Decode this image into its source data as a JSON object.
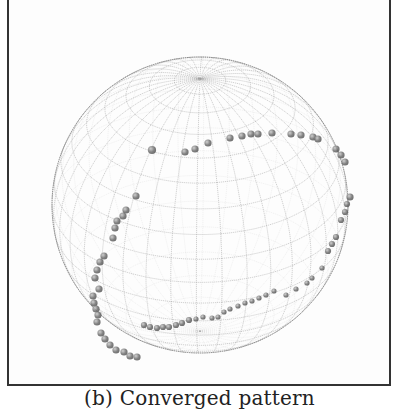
{
  "figure": {
    "caption": "(b) Converged pattern",
    "sphere": {
      "cx": 200,
      "cy": 205,
      "r": 148,
      "wire_color": "#9a9a9a",
      "outline_color": "#777777"
    },
    "point_color": "#6e6e6e",
    "upper_chain": [
      [
        152,
        150,
        7
      ],
      [
        185,
        152,
        6
      ],
      [
        195,
        149,
        6
      ],
      [
        208,
        143,
        6
      ],
      [
        230,
        138,
        6
      ],
      [
        242,
        136,
        6
      ],
      [
        251,
        134,
        6
      ],
      [
        258,
        134,
        6
      ],
      [
        272,
        133,
        6
      ],
      [
        291,
        134,
        6
      ],
      [
        301,
        135,
        6
      ],
      [
        313,
        137,
        6
      ],
      [
        318,
        139,
        6
      ],
      [
        336,
        149,
        6
      ],
      [
        341,
        155,
        6
      ],
      [
        345,
        162,
        6
      ],
      [
        350,
        197,
        6
      ],
      [
        347,
        204,
        5
      ],
      [
        345,
        212,
        5
      ],
      [
        341,
        220,
        5
      ],
      [
        336,
        237,
        5
      ],
      [
        332,
        244,
        5
      ],
      [
        328,
        251,
        5
      ],
      [
        322,
        268,
        4
      ],
      [
        312,
        278,
        4
      ],
      [
        307,
        283,
        4
      ],
      [
        296,
        289,
        4
      ],
      [
        286,
        295,
        4
      ]
    ],
    "left_chain": [
      [
        136,
        196,
        6
      ],
      [
        126,
        210,
        6
      ],
      [
        123,
        216,
        6
      ],
      [
        117,
        221,
        6
      ],
      [
        115,
        228,
        6
      ],
      [
        113,
        238,
        6
      ],
      [
        104,
        256,
        6
      ],
      [
        100,
        262,
        6
      ],
      [
        97,
        270,
        6
      ],
      [
        95,
        278,
        6
      ],
      [
        99,
        289,
        6
      ],
      [
        93,
        296,
        6
      ],
      [
        94,
        303,
        6
      ],
      [
        96,
        309,
        6
      ],
      [
        98,
        315,
        6
      ],
      [
        97,
        322,
        6
      ],
      [
        101,
        333,
        6
      ],
      [
        105,
        339,
        6
      ],
      [
        110,
        345,
        6
      ],
      [
        116,
        350,
        6
      ],
      [
        124,
        352,
        6
      ],
      [
        130,
        356,
        6
      ],
      [
        137,
        357,
        6
      ]
    ],
    "bottom_chain": [
      [
        144,
        325,
        5
      ],
      [
        150,
        327,
        5
      ],
      [
        157,
        328,
        5
      ],
      [
        163,
        327,
        5
      ],
      [
        169,
        327,
        5
      ],
      [
        176,
        325,
        5
      ],
      [
        182,
        323,
        5
      ],
      [
        189,
        320,
        5
      ],
      [
        196,
        319,
        4
      ],
      [
        203,
        317,
        4
      ],
      [
        212,
        318,
        4
      ],
      [
        218,
        317,
        4
      ],
      [
        224,
        312,
        4
      ],
      [
        230,
        309,
        4
      ],
      [
        238,
        306,
        4
      ],
      [
        245,
        303,
        4
      ],
      [
        252,
        301,
        4
      ],
      [
        259,
        298,
        4
      ],
      [
        266,
        295,
        4
      ],
      [
        274,
        291,
        4
      ]
    ]
  }
}
